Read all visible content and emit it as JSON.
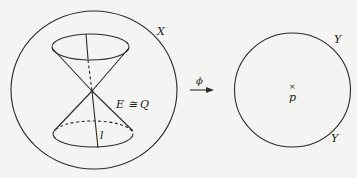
{
  "left_figure": {
    "space_label": "X",
    "cone_label": "E ≅ Q",
    "line_label": "l"
  },
  "map": {
    "arrow_label": "ϕ"
  },
  "right_figure": {
    "curve_label_top": "Y",
    "curve_label_bottom": "Y",
    "point_marker": "×",
    "point_label": "p"
  },
  "colors": {
    "stroke": "#2a2a2a",
    "background": "#f4f4f2"
  }
}
